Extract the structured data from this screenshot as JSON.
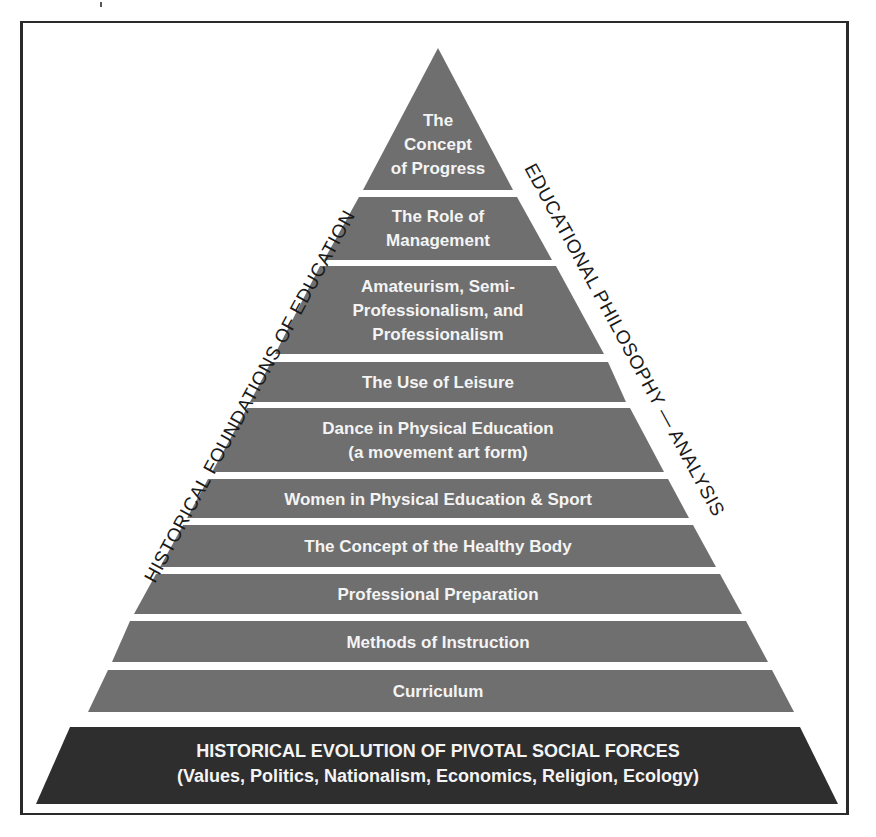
{
  "diagram": {
    "type": "pyramid",
    "left_side_label": "HISTORICAL FOUNDATIONS OF EDUCATION",
    "right_side_label": "EDUCATIONAL PHILOSOPHY — ANALYSIS",
    "levels_top_to_bottom": [
      {
        "lines": [
          "The",
          "Concept",
          "of Progress"
        ]
      },
      {
        "lines": [
          "The Role of",
          "Management"
        ]
      },
      {
        "lines": [
          "Amateurism, Semi-",
          "Professionalism, and",
          "Professionalism"
        ]
      },
      {
        "lines": [
          "The Use of Leisure"
        ]
      },
      {
        "lines": [
          "Dance in Physical Education",
          "(a movement art form)"
        ]
      },
      {
        "lines": [
          "Women in Physical Education & Sport"
        ]
      },
      {
        "lines": [
          "The Concept of the Healthy Body"
        ]
      },
      {
        "lines": [
          "Professional Preparation"
        ]
      },
      {
        "lines": [
          "Methods of Instruction"
        ]
      },
      {
        "lines": [
          "Curriculum"
        ]
      }
    ],
    "base": {
      "title": "HISTORICAL EVOLUTION OF PIVOTAL SOCIAL FORCES",
      "subtitle": "(Values, Politics, Nationalism, Economics, Religion, Ecology)"
    },
    "colors": {
      "band_fill": "#6f6f6f",
      "base_fill": "#2e2e2e",
      "band_text": "#f4f4f4",
      "side_text": "#1a1a1a",
      "frame": "#2a2a2a"
    }
  }
}
